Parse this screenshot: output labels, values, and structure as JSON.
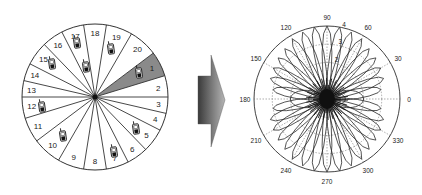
{
  "left_diagram": {
    "title": "sector-partitioned cell with mobile users",
    "center": [
      95,
      97
    ],
    "radius": 73,
    "boundary_angles_deg": [
      0,
      17,
      37,
      60,
      81,
      99,
      117,
      134,
      153,
      167,
      180,
      197,
      217,
      240,
      261,
      279,
      297,
      314,
      333,
      347
    ],
    "sectors": [
      {
        "label": "2",
        "from": 0,
        "to": 17
      },
      {
        "label": "1",
        "from": 17,
        "to": 37,
        "highlighted": true
      },
      {
        "label": "20",
        "from": 37,
        "to": 60
      },
      {
        "label": "19",
        "from": 60,
        "to": 81
      },
      {
        "label": "18",
        "from": 81,
        "to": 99
      },
      {
        "label": "17",
        "from": 99,
        "to": 117
      },
      {
        "label": "16",
        "from": 117,
        "to": 134
      },
      {
        "label": "15",
        "from": 134,
        "to": 153
      },
      {
        "label": "14",
        "from": 153,
        "to": 167
      },
      {
        "label": "13",
        "from": 167,
        "to": 180
      },
      {
        "label": "12",
        "from": 180,
        "to": 197
      },
      {
        "label": "11",
        "from": 197,
        "to": 217
      },
      {
        "label": "10",
        "from": 217,
        "to": 240
      },
      {
        "label": "9",
        "from": 240,
        "to": 261
      },
      {
        "label": "8",
        "from": 261,
        "to": 279
      },
      {
        "label": "7",
        "from": 279,
        "to": 297
      },
      {
        "label": "6",
        "from": 297,
        "to": 314
      },
      {
        "label": "5",
        "from": 314,
        "to": 333
      },
      {
        "label": "4",
        "from": 333,
        "to": 347
      },
      {
        "label": "3",
        "from": 347,
        "to": 360
      }
    ],
    "highlight_color": "#8a8a8a",
    "phones": [
      {
        "sector": "17",
        "x": 77,
        "y": 43
      },
      {
        "sector": "17",
        "x": 86,
        "y": 67
      },
      {
        "sector": "19",
        "x": 111,
        "y": 49
      },
      {
        "sector": "1",
        "x": 139,
        "y": 73
      },
      {
        "sector": "15",
        "x": 52,
        "y": 64
      },
      {
        "sector": "12",
        "x": 42,
        "y": 107
      },
      {
        "sector": "10",
        "x": 63,
        "y": 136
      },
      {
        "sector": "7",
        "x": 114,
        "y": 152
      },
      {
        "sector": "5",
        "x": 136,
        "y": 129
      }
    ]
  },
  "arrow": {
    "direction": "right",
    "color_dark": "#3c3c3c",
    "color_light": "#a0a0a0"
  },
  "right_diagram": {
    "title": "multi-beam polar radiation pattern",
    "center": [
      327,
      99
    ],
    "radius": 73,
    "angle_labels": [
      "0",
      "30",
      "60",
      "90",
      "120",
      "150",
      "180",
      "210",
      "240",
      "270",
      "300",
      "330"
    ],
    "ring_labels": [
      "2",
      "3",
      "4"
    ],
    "r_max": 4
  },
  "chart_data": {
    "type": "polar",
    "title": "",
    "theta_ticks_deg": [
      0,
      30,
      60,
      90,
      120,
      150,
      180,
      210,
      240,
      270,
      300,
      330
    ],
    "r_ticks": [
      1,
      2,
      3,
      4
    ],
    "r_tick_labels_visible": [
      2,
      3,
      4
    ],
    "rlim": [
      0,
      4
    ],
    "grid": "dotted",
    "series": [
      {
        "name": "beam lobes",
        "lobe_directions_deg": [
          10,
          20,
          30,
          40,
          50,
          60,
          70,
          80,
          90,
          100,
          110,
          120,
          130,
          140,
          150,
          160,
          170,
          190,
          200,
          210,
          220,
          230,
          240,
          250,
          260,
          270,
          280,
          290,
          300,
          310,
          320,
          330,
          340,
          350
        ],
        "approx_peak_r": [
          3.0,
          3.3,
          3.4,
          3.5,
          3.6,
          3.8,
          3.9,
          4.0,
          4.0,
          4.0,
          3.9,
          3.8,
          3.6,
          3.5,
          3.4,
          3.3,
          3.0,
          3.0,
          3.3,
          3.4,
          3.5,
          3.6,
          3.8,
          3.9,
          4.0,
          4.0,
          4.0,
          3.9,
          3.8,
          3.6,
          3.5,
          3.4,
          3.3,
          3.0
        ]
      },
      {
        "name": "broadside loops",
        "lobe_directions_deg": [
          0,
          180
        ],
        "approx_peak_r": [
          2.0,
          2.0
        ]
      },
      {
        "name": "inner loops",
        "lobe_directions_deg": [
          0,
          180
        ],
        "approx_peak_r": [
          1.0,
          1.0
        ]
      }
    ]
  }
}
